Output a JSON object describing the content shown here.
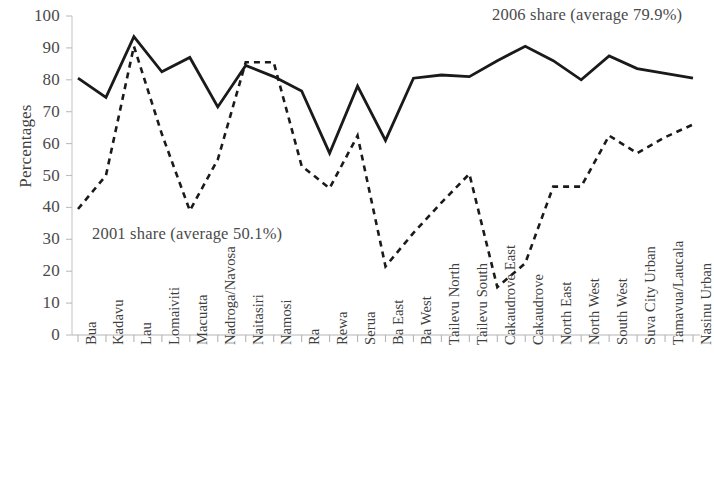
{
  "chart_data": {
    "type": "line",
    "title": "",
    "subtitle": "",
    "xlabel": "",
    "ylabel": "Percentages",
    "ylim": [
      0,
      100
    ],
    "ytick_step": 10,
    "yticks": [
      100,
      90,
      80,
      70,
      60,
      50,
      40,
      30,
      20,
      10,
      0
    ],
    "grid": false,
    "legend_position": "inline-annotations",
    "categories": [
      "Bua",
      "Kadavu",
      "Lau",
      "Lomaiviti",
      "Macuata",
      "Nadroga/Navosa",
      "Naitasiri",
      "Namosi",
      "Ra",
      "Rewa",
      "Serua",
      "Ba East",
      "Ba West",
      "Tailevu North",
      "Tailevu South",
      "Cakaudrove East",
      "Cakaudrove",
      "North East",
      "North West",
      "South West",
      "Suva City Urban",
      "Tamavua/Laucala",
      "Nasinu Urban"
    ],
    "series": [
      {
        "name": "2006 share",
        "style": "solid",
        "color": "#1a1a1a",
        "average": 79.9,
        "annotation": "2006 share (average 79.9%)",
        "values": [
          80.5,
          74.5,
          93.5,
          82.5,
          87,
          71.5,
          84.5,
          81,
          76.5,
          57,
          78,
          61,
          80.5,
          81.5,
          81,
          86,
          90.5,
          86,
          80,
          87.5,
          83.5,
          82,
          80.5
        ]
      },
      {
        "name": "2001 share",
        "style": "dashed",
        "color": "#1a1a1a",
        "average": 50.1,
        "annotation": "2001 share (average 50.1%)",
        "values": [
          39.5,
          50,
          90.5,
          63,
          39,
          55,
          85.5,
          85.5,
          53,
          46,
          62.5,
          21.5,
          32,
          41.5,
          50.5,
          15,
          22.5,
          46.5,
          46.5,
          62.5,
          57,
          62,
          66
        ]
      }
    ],
    "annotations": [
      {
        "text": "2006 share (average 79.9%)",
        "x_px": 492,
        "y_px": 5
      },
      {
        "text": "2001 share (average 50.1%)",
        "x_px": 92,
        "y_px": 224
      }
    ]
  },
  "axis": {
    "y_title": "Percentages"
  }
}
